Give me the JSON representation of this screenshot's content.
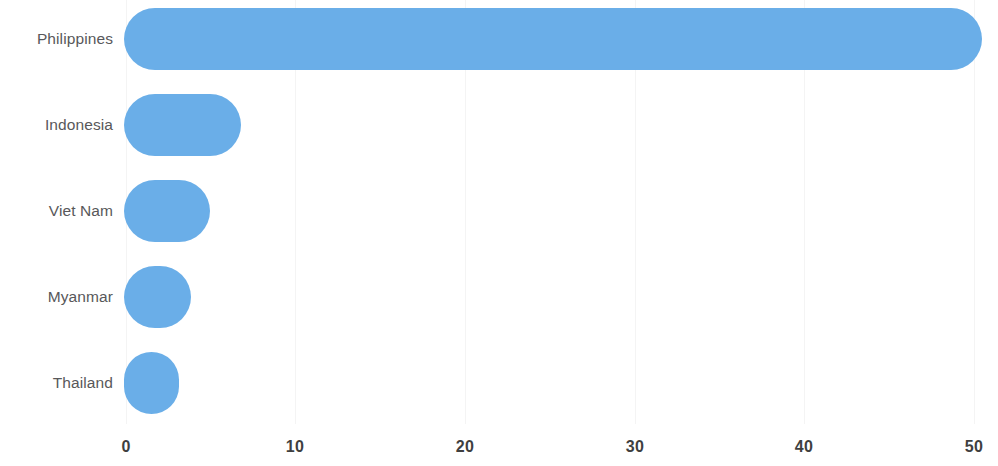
{
  "chart_data": {
    "type": "bar",
    "orientation": "horizontal",
    "title": "",
    "subtitle": "",
    "xlabel": "",
    "ylabel": "",
    "categories": [
      "Philippines",
      "Indonesia",
      "Viet Nam",
      "Myanmar",
      "Thailand"
    ],
    "values": [
      50.0,
      6.6,
      4.8,
      3.7,
      3.0
    ],
    "series": [
      {
        "name": "",
        "values": [
          50.0,
          6.6,
          4.8,
          3.7,
          3.0
        ]
      }
    ],
    "xlim": [
      0,
      50
    ],
    "ylim": null,
    "xticks": [
      0,
      10,
      20,
      30,
      40,
      50
    ],
    "xtick_labels": [
      "0",
      "10",
      "20",
      "30",
      "40",
      "50"
    ],
    "grid": "vertical-faint",
    "legend": null,
    "legend_position": "none",
    "annotations": [],
    "bar_color": "#6aaee8",
    "label_color": "#58585a",
    "tick_color": "#3f3f3f",
    "background_color": "#ffffff",
    "bar_style": "rounded-caps"
  },
  "axis": {
    "x_min": 0,
    "x_max": 50,
    "tick_step": 10
  }
}
